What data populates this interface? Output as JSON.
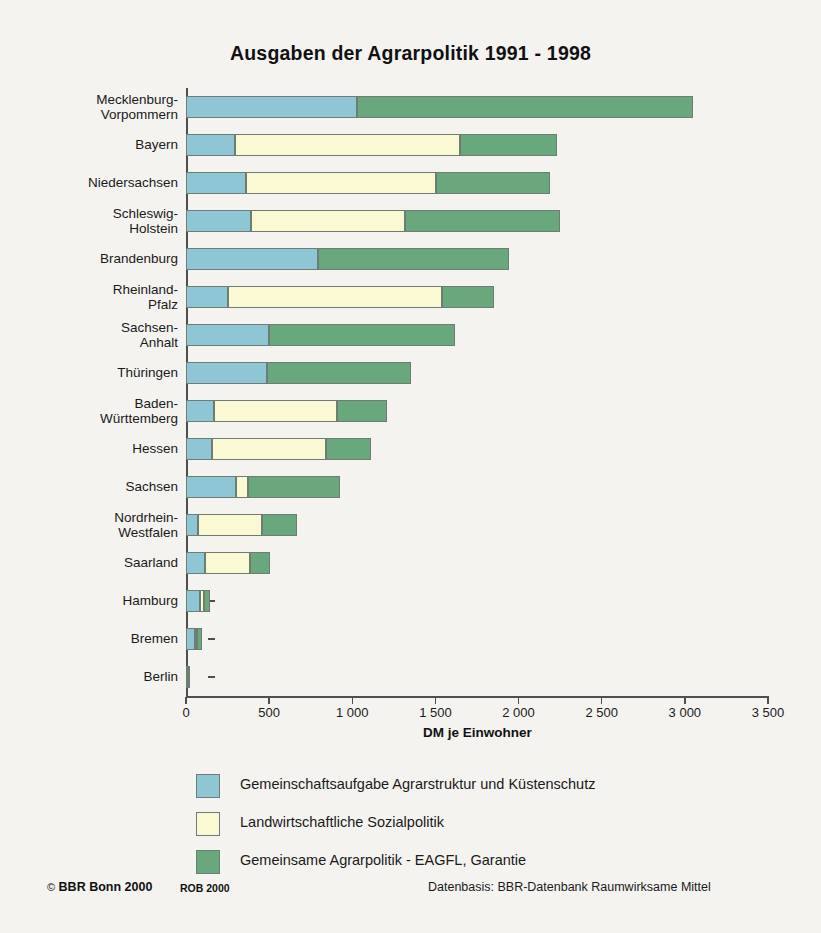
{
  "figure": {
    "title": "Ausgaben der Agrarpolitik 1991 - 1998",
    "background": "#f4f3f0"
  },
  "colors": {
    "series_a": "#8ec6d6",
    "series_b": "#fbf9d3",
    "series_c": "#68a87c",
    "axis": "#4f4f4f",
    "outline": "#6f7c74"
  },
  "legend": {
    "position": "below-axis",
    "entries": [
      {
        "color": "#8ec6d6",
        "label": "Gemeinschaftsaufgabe Agrarstruktur und Küstenschutz"
      },
      {
        "color": "#fbf9d3",
        "label": "Landwirtschaftliche Sozialpolitik"
      },
      {
        "color": "#68a87c",
        "label": "Gemeinsame Agrarpolitik - EAGFL, Garantie"
      }
    ]
  },
  "footer": {
    "copyright_mark": "©",
    "copyright": "BBR Bonn 2000",
    "rob": "ROB 2000",
    "source": "Datenbasis: BBR-Datenbank Raumwirksame Mittel"
  },
  "chart_data": {
    "type": "bar",
    "orientation": "horizontal",
    "stacked": true,
    "title": "Ausgaben der Agrarpolitik 1991 - 1998",
    "xlabel": "DM je Einwohner",
    "ylabel": "",
    "xlim": [
      0,
      3500
    ],
    "xticks": [
      0,
      500,
      1000,
      1500,
      2000,
      2500,
      3000,
      3500
    ],
    "xticklabels": [
      "0",
      "500",
      "1 000",
      "1 500",
      "2 000",
      "2 500",
      "3 000",
      "3 500"
    ],
    "grid": false,
    "categories": [
      "Mecklenburg-\nVorpommern",
      "Bayern",
      "Niedersachsen",
      "Schleswig-\nHolstein",
      "Brandenburg",
      "Rheinland-\nPfalz",
      "Sachsen-\nAnhalt",
      "Thüringen",
      "Baden-\nWürttemberg",
      "Hessen",
      "Sachsen",
      "Nordrhein-\nWestfalen",
      "Saarland",
      "Hamburg",
      "Bremen",
      "Berlin"
    ],
    "series": [
      {
        "name": "Gemeinschaftsaufgabe Agrarstruktur und Küstenschutz",
        "color": "#8ec6d6",
        "values": [
          1030,
          295,
          360,
          390,
          795,
          255,
          500,
          490,
          170,
          155,
          300,
          70,
          115,
          85,
          55,
          12
        ]
      },
      {
        "name": "Landwirtschaftliche Sozialpolitik",
        "color": "#fbf9d3",
        "values": [
          0,
          1355,
          1145,
          925,
          0,
          1285,
          0,
          0,
          740,
          685,
          70,
          385,
          270,
          25,
          10,
          0
        ]
      },
      {
        "name": "Gemeinsame Agrarpolitik - EAGFL, Garantie",
        "color": "#68a87c",
        "values": [
          2020,
          580,
          685,
          935,
          1145,
          310,
          1120,
          865,
          300,
          275,
          555,
          215,
          120,
          35,
          30,
          6
        ]
      }
    ],
    "totals": [
      3050,
      2230,
      2190,
      2250,
      1940,
      1850,
      1620,
      1355,
      1210,
      1115,
      925,
      670,
      505,
      145,
      95,
      18
    ]
  }
}
